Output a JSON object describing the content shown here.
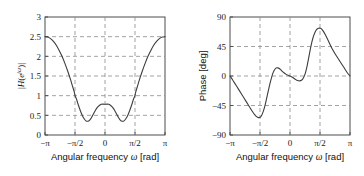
{
  "figure": {
    "background_color": "#ffffff",
    "axis_color": "#4d4d4d",
    "grid_color": "#8c8c8c",
    "curve_color": "#3d3d3d"
  },
  "chart_data": [
    {
      "type": "line",
      "title": "",
      "panel": "left",
      "xlabel_prefix": "Angular frequency ",
      "xlabel_symbol": "ω",
      "xlabel_suffix": " [rad]",
      "ylabel": "|H(e^{jω})|",
      "ylabel_parts": {
        "bar_open": "|",
        "H": "H",
        "paren_open": "(",
        "e": "e",
        "exp_j": "j",
        "exp_omega": "ω",
        "paren_close": ")",
        "bar_close": "|"
      },
      "xlim": [
        -3.141592653589793,
        3.141592653589793
      ],
      "ylim": [
        0,
        3
      ],
      "xticks": [
        -3.141592653589793,
        -1.5707963267948966,
        0,
        1.5707963267948966,
        3.141592653589793
      ],
      "xticklabels": [
        "−π",
        "−π/2",
        "0",
        "π/2",
        "π"
      ],
      "yticks": [
        0,
        0.5,
        1,
        1.5,
        2,
        2.5,
        3
      ],
      "yticklabels": [
        "0",
        "0.5",
        "1",
        "1.5",
        "2",
        "2.5",
        "3"
      ],
      "grid": true,
      "grid_style": "dashed",
      "legend": null,
      "x": [
        -3.1416,
        -3.0,
        -2.85,
        -2.7,
        -2.55,
        -2.4,
        -2.25,
        -2.1,
        -1.95,
        -1.8,
        -1.7,
        -1.6,
        -1.5708,
        -1.5,
        -1.4,
        -1.3,
        -1.2,
        -1.1,
        -1.0,
        -0.9,
        -0.8,
        -0.7,
        -0.6,
        -0.5,
        -0.4,
        -0.3,
        -0.2,
        -0.1,
        0.0,
        0.1,
        0.2,
        0.3,
        0.4,
        0.5,
        0.6,
        0.7,
        0.8,
        0.9,
        1.0,
        1.1,
        1.2,
        1.3,
        1.4,
        1.5,
        1.5708,
        1.6,
        1.7,
        1.8,
        1.95,
        2.1,
        2.25,
        2.4,
        2.55,
        2.7,
        2.85,
        3.0,
        3.1416
      ],
      "y": [
        2.5,
        2.49,
        2.45,
        2.38,
        2.28,
        2.15,
        2.0,
        1.82,
        1.62,
        1.4,
        1.24,
        1.08,
        1.0,
        0.92,
        0.77,
        0.63,
        0.51,
        0.42,
        0.36,
        0.35,
        0.38,
        0.45,
        0.54,
        0.63,
        0.7,
        0.75,
        0.78,
        0.785,
        0.78,
        0.785,
        0.78,
        0.75,
        0.7,
        0.63,
        0.54,
        0.45,
        0.38,
        0.35,
        0.36,
        0.42,
        0.51,
        0.63,
        0.77,
        0.92,
        1.0,
        1.08,
        1.24,
        1.4,
        1.62,
        1.82,
        2.0,
        2.15,
        2.28,
        2.38,
        2.45,
        2.49,
        2.5
      ],
      "annotations": {
        "value_at_minus_pi": 2.5,
        "value_at_zero": 0.78,
        "minima_value": 0.35,
        "minima_locations": [
          -0.9,
          0.9
        ],
        "value_at_pi": 2.5
      }
    },
    {
      "type": "line",
      "title": "",
      "panel": "right",
      "xlabel_prefix": "Angular frequency ",
      "xlabel_symbol": "ω",
      "xlabel_suffix": " [rad]",
      "ylabel": "Phase [deg]",
      "xlim": [
        -3.141592653589793,
        3.141592653589793
      ],
      "ylim": [
        -90,
        90
      ],
      "xticks": [
        -3.141592653589793,
        -1.5707963267948966,
        0,
        1.5707963267948966,
        3.141592653589793
      ],
      "xticklabels": [
        "−π",
        "−π/2",
        "0",
        "π/2",
        "π"
      ],
      "yticks": [
        -90,
        -45,
        0,
        45,
        90
      ],
      "yticklabels": [
        "−90",
        "−45",
        "0",
        "45",
        "90"
      ],
      "grid": true,
      "grid_style": "dashed",
      "legend": null,
      "x": [
        -3.1416,
        -3.0,
        -2.85,
        -2.7,
        -2.55,
        -2.4,
        -2.25,
        -2.1,
        -1.95,
        -1.85,
        -1.75,
        -1.65,
        -1.5708,
        -1.5,
        -1.4,
        -1.3,
        -1.2,
        -1.1,
        -1.0,
        -0.9,
        -0.8,
        -0.7,
        -0.6,
        -0.5,
        -0.4,
        -0.3,
        -0.2,
        -0.1,
        0.0,
        0.1,
        0.2,
        0.3,
        0.4,
        0.5,
        0.6,
        0.7,
        0.8,
        0.9,
        1.0,
        1.1,
        1.2,
        1.3,
        1.4,
        1.5,
        1.5708,
        1.65,
        1.75,
        1.85,
        2.0,
        2.2,
        2.4,
        2.6,
        2.8,
        3.0,
        3.1416
      ],
      "y": [
        0,
        -6,
        -13,
        -20,
        -27,
        -34,
        -41,
        -48,
        -55,
        -59,
        -62,
        -63.5,
        -63,
        -61,
        -54,
        -44,
        -31,
        -18,
        -6,
        4,
        10,
        12.5,
        12,
        10,
        7,
        4.5,
        2.5,
        1,
        0,
        -1.5,
        -3.5,
        -5.5,
        -7,
        -7.5,
        -6.5,
        -3,
        4,
        16,
        31,
        46,
        58,
        66,
        71,
        72.8,
        73,
        72,
        68,
        63,
        54,
        42,
        32,
        23,
        14,
        5,
        0
      ],
      "annotations": {
        "value_at_minus_pi": 0,
        "minimum_value": -63.5,
        "minimum_location": -1.65,
        "local_max_near_minus_0p7": 12.5,
        "value_at_zero": 0,
        "maximum_value": 73,
        "maximum_location": 1.5708,
        "value_at_pi": 0
      }
    }
  ]
}
